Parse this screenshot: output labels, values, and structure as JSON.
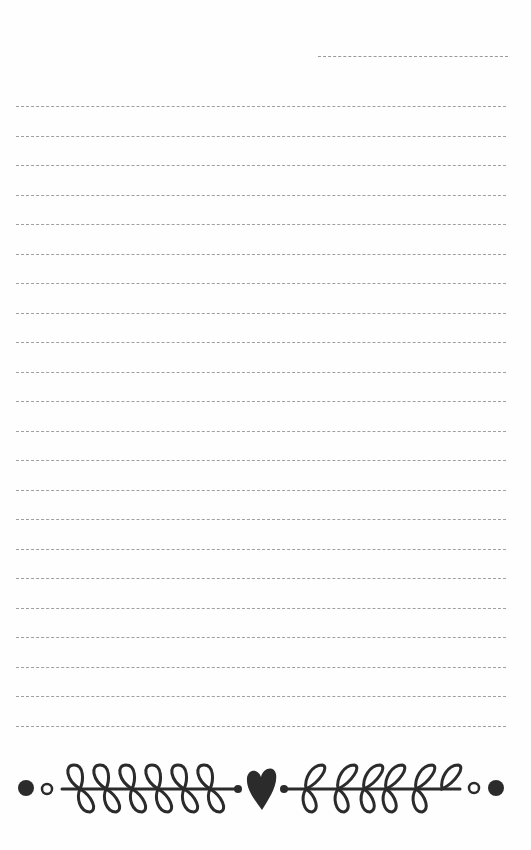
{
  "page": {
    "type": "lined notepaper",
    "date_line": {
      "value": ""
    },
    "writing_lines": [
      "",
      "",
      "",
      "",
      "",
      "",
      "",
      "",
      "",
      "",
      "",
      "",
      "",
      "",
      "",
      "",
      "",
      "",
      "",
      "",
      "",
      ""
    ],
    "line_count": 22,
    "ornament": {
      "icons": [
        "dot-icon",
        "ring-icon",
        "leaf-branch-left-icon",
        "heart-icon",
        "leaf-branch-right-icon",
        "ring-icon",
        "dot-icon"
      ],
      "color": "#2b2b2b"
    },
    "colors": {
      "background": "#fefefe",
      "dash": "#a0a0a0",
      "ink": "#2b2b2b"
    }
  }
}
